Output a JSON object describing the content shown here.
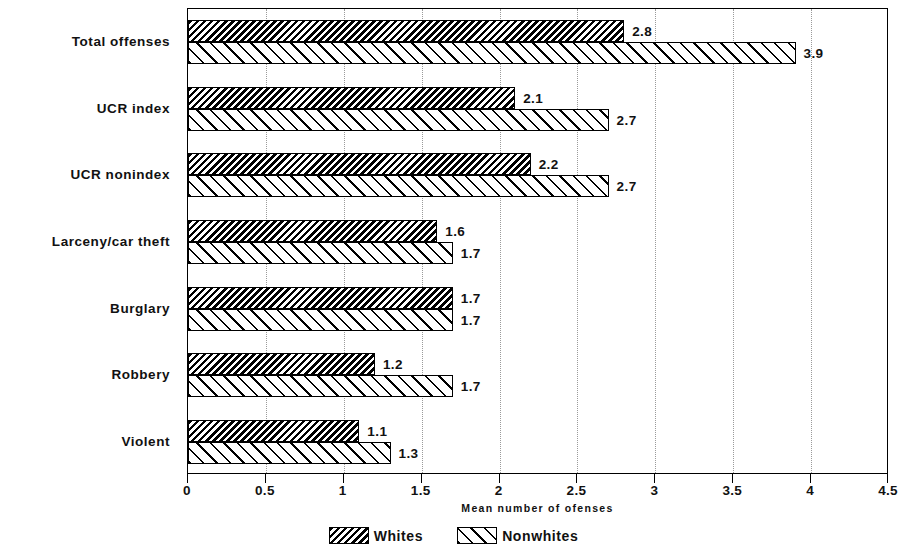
{
  "chart_data": {
    "type": "bar",
    "orientation": "horizontal",
    "title": "",
    "subtitle": "",
    "xlabel": "Mean number of ofenses",
    "ylabel": "",
    "xlim": [
      0,
      4.5
    ],
    "xticks": [
      0,
      0.5,
      1,
      1.5,
      2,
      2.5,
      3,
      3.5,
      4,
      4.5
    ],
    "xtick_labels": [
      "0",
      "0.5",
      "1",
      "1.5",
      "2",
      "2.5",
      "3",
      "3.5",
      "4",
      "4.5"
    ],
    "grid": "vertical-dotted",
    "legend_position": "bottom-center",
    "categories": [
      "Total offenses",
      "UCR index",
      "UCR nonindex",
      "Larceny/car theft",
      "Burglary",
      "Robbery",
      "Violent"
    ],
    "series": [
      {
        "name": "Whites",
        "pattern": "dense-backslash-hatch",
        "values": [
          2.8,
          2.1,
          2.2,
          1.6,
          1.7,
          1.2,
          1.1
        ],
        "value_labels": [
          "2.8",
          "2.1",
          "2.2",
          "1.6",
          "1.7",
          "1.2",
          "1.1"
        ]
      },
      {
        "name": "Nonwhites",
        "pattern": "sparse-forwardslash-hatch",
        "values": [
          3.9,
          2.7,
          2.7,
          1.7,
          1.7,
          1.7,
          1.3
        ],
        "value_labels": [
          "3.9",
          "2.7",
          "2.7",
          "1.7",
          "1.7",
          "1.7",
          "1.3"
        ]
      }
    ],
    "colors": {
      "foreground": "#000000",
      "background": "#ffffff",
      "gridline": "#9a9a9a"
    }
  },
  "legend": {
    "entries": [
      {
        "label": "Whites",
        "swatch": "dense-backslash-hatch"
      },
      {
        "label": "Nonwhites",
        "swatch": "sparse-forwardslash-hatch"
      }
    ]
  }
}
